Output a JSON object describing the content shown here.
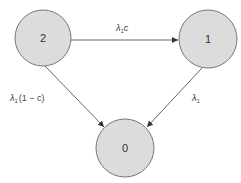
{
  "diagram": {
    "type": "state-transition",
    "colors": {
      "node_fill": "#dcdcdc",
      "node_stroke": "#777777",
      "edge": "#555555",
      "text": "#333333"
    },
    "nodes": [
      {
        "id": "2",
        "label": "2",
        "cx": 43,
        "cy": 38,
        "r": 28
      },
      {
        "id": "1",
        "label": "1",
        "cx": 208,
        "cy": 39,
        "r": 29
      },
      {
        "id": "0",
        "label": "0",
        "cx": 125,
        "cy": 148,
        "r": 29
      }
    ],
    "edges": [
      {
        "from": "2",
        "to": "1",
        "label_main": "λ",
        "label_sub": "1",
        "label_tail": "c"
      },
      {
        "from": "2",
        "to": "0",
        "label_main": "λ",
        "label_sub": "1",
        "label_tail": "(1 − c)"
      },
      {
        "from": "1",
        "to": "0",
        "label_main": "λ",
        "label_sub": "1",
        "label_tail": ""
      }
    ]
  }
}
